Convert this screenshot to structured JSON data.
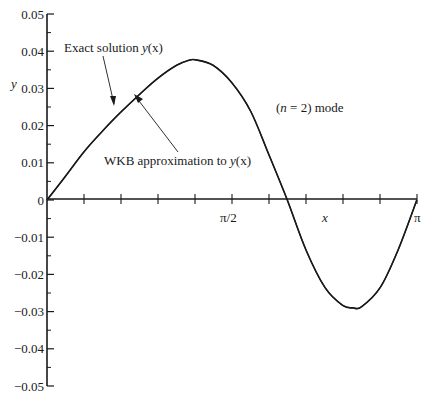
{
  "chart_data": {
    "type": "line",
    "title": "",
    "xlabel": "x",
    "ylabel": "y",
    "xlim": [
      0,
      3.14159
    ],
    "ylim": [
      -0.05,
      0.05
    ],
    "x_ticks": [
      {
        "value": 0,
        "label": ""
      },
      {
        "value": 0.31416,
        "label": ""
      },
      {
        "value": 0.62832,
        "label": ""
      },
      {
        "value": 0.94248,
        "label": ""
      },
      {
        "value": 1.25664,
        "label": ""
      },
      {
        "value": 1.5708,
        "label": "π/2"
      },
      {
        "value": 1.88496,
        "label": ""
      },
      {
        "value": 2.19911,
        "label": ""
      },
      {
        "value": 2.51327,
        "label": ""
      },
      {
        "value": 2.82743,
        "label": ""
      },
      {
        "value": 3.14159,
        "label": "π"
      }
    ],
    "y_ticks": [
      "0.05",
      "0.04",
      "0.03",
      "0.02",
      "0.01",
      "0",
      "-0.01",
      "-0.02",
      "-0.03",
      "-0.04",
      "-0.05"
    ],
    "y_tick_values": [
      0.05,
      0.04,
      0.03,
      0.02,
      0.01,
      0,
      -0.01,
      -0.02,
      -0.03,
      -0.04,
      -0.05
    ],
    "grid": false,
    "legend": null,
    "series": [
      {
        "name": "Exact solution y(x)",
        "x": [
          0,
          0.16,
          0.31,
          0.47,
          0.63,
          0.79,
          0.94,
          1.1,
          1.2,
          1.26,
          1.41,
          1.57,
          1.73,
          1.88,
          2.04,
          2.2,
          2.36,
          2.51,
          2.6,
          2.67,
          2.83,
          2.98,
          3.14
        ],
        "y": [
          0,
          0.0065,
          0.0128,
          0.0185,
          0.0237,
          0.0285,
          0.0327,
          0.0362,
          0.0375,
          0.0377,
          0.0362,
          0.0315,
          0.0238,
          0.0125,
          0.0,
          -0.0135,
          -0.0235,
          -0.0283,
          -0.029,
          -0.0287,
          -0.0235,
          -0.0135,
          0
        ]
      },
      {
        "name": "WKB approximation to y(x)",
        "x": [
          0,
          0.16,
          0.31,
          0.47,
          0.63,
          0.79,
          0.94,
          1.1,
          1.2,
          1.26,
          1.41,
          1.57,
          1.73,
          1.88,
          2.04,
          2.2,
          2.36,
          2.51,
          2.6,
          2.67,
          2.83,
          2.98,
          3.14
        ],
        "y": [
          0,
          0.0065,
          0.0128,
          0.0185,
          0.0237,
          0.0285,
          0.0327,
          0.0362,
          0.0375,
          0.0377,
          0.0362,
          0.0315,
          0.0238,
          0.0125,
          0.0,
          -0.0135,
          -0.0235,
          -0.0283,
          -0.029,
          -0.0287,
          -0.0235,
          -0.0135,
          0
        ]
      }
    ],
    "annotations": [
      {
        "text": "Exact solution y(x)",
        "arrow_to": {
          "x": 0.62,
          "y": 0.024
        }
      },
      {
        "text": "WKB approximation to y(x)",
        "arrow_to": {
          "x": 0.7,
          "y": 0.029
        }
      },
      {
        "text": "(n = 2) mode"
      }
    ]
  },
  "labels": {
    "y_axis": "y",
    "x_axis": "x",
    "x_half_pi": "π/2",
    "x_pi": "π",
    "exact_prefix": "Exact solution ",
    "exact_fn": "y",
    "exact_arg": "(x)",
    "wkb_prefix": "WKB approximation to ",
    "wkb_fn": "y",
    "wkb_arg": "(x)",
    "mode_open": "(",
    "mode_n": "n",
    "mode_rest": " = 2) mode"
  }
}
